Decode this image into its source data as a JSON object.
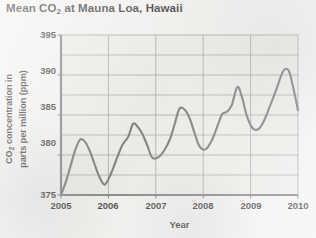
{
  "chart_data": {
    "type": "line",
    "title": "Mean CO2 at Mauna Loa, Hawaii",
    "title_prefix": "Mean CO",
    "title_sub": "2",
    "title_suffix": " at Mauna Loa, Hawaii",
    "xlabel": "Year",
    "ylabel_line1_prefix": "CO",
    "ylabel_line1_sub": "2",
    "ylabel_line1_suffix": " concentration in",
    "ylabel_line2": "parts per million (ppm)",
    "ylabel": "CO2 concentration in parts per million (ppm)",
    "xlim": [
      2005,
      2010
    ],
    "ylim": [
      375,
      395
    ],
    "xticks": [
      2005,
      2006,
      2007,
      2008,
      2009,
      2010
    ],
    "xtick_labels": [
      "2005",
      "2006",
      "2007",
      "2008",
      "2009",
      "2010"
    ],
    "yticks": [
      375,
      380,
      385,
      390,
      395
    ],
    "ytick_labels": [
      "375",
      "380",
      "385",
      "390",
      "395"
    ],
    "y_minor_gridlines": [
      377.5,
      382.5,
      387.5,
      392.5
    ],
    "grid": true,
    "legend": null,
    "line_color": "#5f5f5f",
    "grid_color": "#9a9a9a",
    "axis_color": "#6e6e6e",
    "plot_background": "#eceae7",
    "page_background": "#f2f1ef",
    "series": [
      {
        "name": "Mean CO2 concentration",
        "x": [
          2005.0,
          2005.1,
          2005.2,
          2005.3,
          2005.4,
          2005.5,
          2005.6,
          2005.7,
          2005.8,
          2005.92,
          2006.05,
          2006.18,
          2006.3,
          2006.42,
          2006.52,
          2006.62,
          2006.72,
          2006.82,
          2006.92,
          2007.05,
          2007.18,
          2007.3,
          2007.4,
          2007.5,
          2007.62,
          2007.72,
          2007.82,
          2007.92,
          2008.05,
          2008.18,
          2008.3,
          2008.4,
          2008.5,
          2008.6,
          2008.72,
          2008.82,
          2008.92,
          2009.05,
          2009.18,
          2009.3,
          2009.42,
          2009.55,
          2009.68,
          2009.8,
          2009.9,
          2010.0
        ],
        "y": [
          375.0,
          376.6,
          378.6,
          380.6,
          381.9,
          381.7,
          380.6,
          379.0,
          377.4,
          376.3,
          377.6,
          379.6,
          381.3,
          382.3,
          383.9,
          383.5,
          382.6,
          381.2,
          379.7,
          379.7,
          380.6,
          382.0,
          383.9,
          385.8,
          385.6,
          384.5,
          382.7,
          381.1,
          380.7,
          381.8,
          383.6,
          385.1,
          385.4,
          386.2,
          388.5,
          387.2,
          384.9,
          383.3,
          383.3,
          384.5,
          386.3,
          388.3,
          390.4,
          390.6,
          388.4,
          385.6
        ]
      }
    ]
  }
}
